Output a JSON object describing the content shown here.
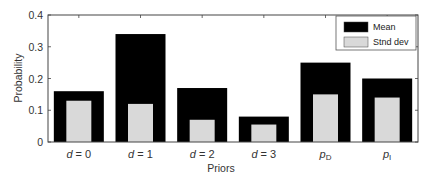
{
  "chart_data": {
    "type": "bar",
    "title": "",
    "xlabel": "Priors",
    "ylabel": "Probability",
    "ylim": [
      0,
      0.4
    ],
    "yticks": [
      "0",
      "0.1",
      "0.2",
      "0.3",
      "0.4"
    ],
    "grid": false,
    "legend_position": "upper right",
    "categories": [
      "d=0",
      "d=1",
      "d=2",
      "d=3",
      "pD",
      "pI"
    ],
    "category_labels": [
      {
        "main": "d",
        "rest": " = 0",
        "sub": ""
      },
      {
        "main": "d",
        "rest": " = 1",
        "sub": ""
      },
      {
        "main": "d",
        "rest": " = 2",
        "sub": ""
      },
      {
        "main": "d",
        "rest": " = 3",
        "sub": ""
      },
      {
        "main": "p",
        "rest": "",
        "sub": "D"
      },
      {
        "main": "p",
        "rest": "",
        "sub": "I"
      }
    ],
    "series": [
      {
        "name": "Mean",
        "color": "#000000",
        "values": [
          0.16,
          0.34,
          0.17,
          0.08,
          0.25,
          0.2
        ]
      },
      {
        "name": "Stnd dev",
        "color": "#d9d9d9",
        "values": [
          0.13,
          0.12,
          0.07,
          0.055,
          0.15,
          0.14
        ]
      }
    ]
  }
}
